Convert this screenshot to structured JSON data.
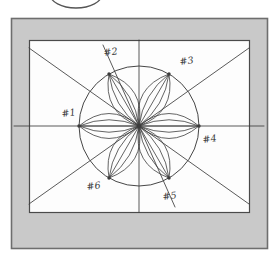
{
  "figure": {
    "medium": "hand-drawn pencil sketch, scanned",
    "canvas": {
      "width": 278,
      "height": 262
    },
    "colors": {
      "page_background": "#ffffff",
      "mat_background": "#c9c9c9",
      "mat_border": "#6e6e6e",
      "inner_panel": "#fdfdfd",
      "inner_panel_border": "#4a4a4a",
      "ink": "#3c3c3c",
      "ink_light": "#555555"
    },
    "mat": {
      "x": 11,
      "y": 18,
      "width": 256,
      "height": 230
    },
    "panel": {
      "x": 29,
      "y": 40,
      "width": 220,
      "height": 172
    },
    "top_arc": {
      "name": "clipped-ellipse-arc",
      "cx": 76,
      "cy": -6,
      "rx": 26,
      "ry": 14,
      "note": "partial ellipse cut off by top edge of the scan"
    },
    "circle": {
      "cx": 139,
      "cy": 126,
      "r": 60
    },
    "center_point": {
      "x": 139,
      "y": 126
    },
    "labels": [
      {
        "id": "1",
        "text": "#1",
        "point_x": 79,
        "point_y": 126,
        "label_x": 62,
        "label_y": 117,
        "angle_deg": 180
      },
      {
        "id": "2",
        "text": "#2",
        "point_x": 109,
        "point_y": 74,
        "label_x": 104,
        "label_y": 56,
        "angle_deg": 120
      },
      {
        "id": "3",
        "text": "#3",
        "point_x": 169,
        "point_y": 74,
        "label_x": 180,
        "label_y": 65,
        "angle_deg": 60
      },
      {
        "id": "4",
        "text": "#4",
        "point_x": 199,
        "point_y": 126,
        "label_x": 203,
        "label_y": 143,
        "angle_deg": 0
      },
      {
        "id": "5",
        "text": "#5",
        "point_x": 169,
        "point_y": 178,
        "label_x": 163,
        "label_y": 200,
        "angle_deg": 300
      },
      {
        "id": "6",
        "text": "#6",
        "point_x": 109,
        "point_y": 178,
        "label_x": 87,
        "label_y": 190,
        "angle_deg": 240
      }
    ],
    "axes": [
      {
        "name": "horizontal-axis",
        "x1": 14,
        "y1": 126,
        "x2": 264,
        "y2": 126
      },
      {
        "name": "vertical-axis",
        "x1": 139,
        "y1": 40,
        "x2": 139,
        "y2": 212
      },
      {
        "name": "diagonal-down-right",
        "x1": 29,
        "y1": 48,
        "x2": 249,
        "y2": 204
      },
      {
        "name": "diagonal-up-right",
        "x1": 29,
        "y1": 204,
        "x2": 249,
        "y2": 48
      },
      {
        "name": "steep-axis-2-5",
        "x1": 103,
        "y1": 45,
        "x2": 175,
        "y2": 207
      }
    ],
    "petal_count": 6,
    "arcs_per_petal": 5
  }
}
